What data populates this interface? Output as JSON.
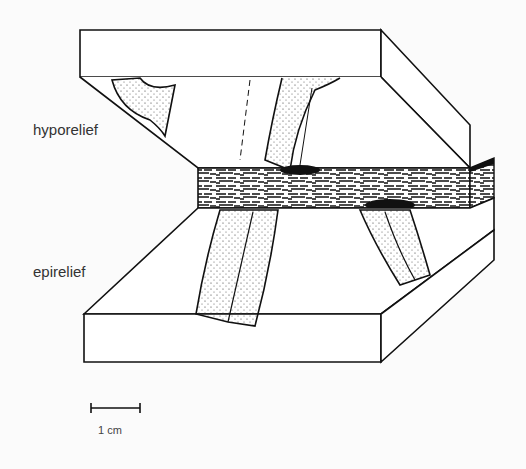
{
  "figure": {
    "type": "block diagram of trace fossil relief in sandstone beds",
    "labels": {
      "upper_block": "hyporelief",
      "lower_block": "epirelief"
    },
    "scale_bar": {
      "label": "1 cm"
    }
  },
  "colors": {
    "line": "#111111",
    "background": "#fbfbfb",
    "mudstone": "#222222"
  }
}
